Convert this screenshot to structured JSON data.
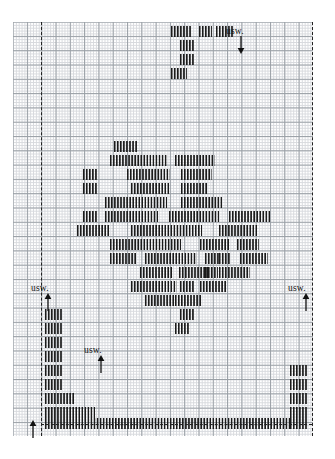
{
  "figure": {
    "type": "tally-mark-histogram-on-graph-paper",
    "width": 335,
    "height": 459,
    "background": "#ffffff",
    "grid": {
      "left": 13,
      "top": 22,
      "width": 300,
      "height": 414,
      "major_cell_px": 14.3,
      "minor_cell_px": 2.86,
      "major_color": "#9aa0a6",
      "minor_color": "#d8dade",
      "columns": 21,
      "rows": 29
    },
    "mark_color": "#1b1b1b",
    "dash_color": "#222222"
  },
  "labels": [
    {
      "id": "usw-top",
      "text": "usw.",
      "x": 226,
      "y": 26,
      "arrow": "down",
      "arrow_x": 236,
      "arrow_y": 36
    },
    {
      "id": "usw-left",
      "text": "usw.",
      "x": 31,
      "y": 283,
      "arrow": "up",
      "arrow_x": 43,
      "arrow_y": 293
    },
    {
      "id": "usw-right",
      "text": "usw.",
      "x": 288,
      "y": 283,
      "arrow": "up",
      "arrow_x": 301,
      "arrow_y": 293
    },
    {
      "id": "usw-middle",
      "text": "usw.",
      "x": 84,
      "y": 345,
      "arrow": "up",
      "arrow_x": 96,
      "arrow_y": 355
    }
  ],
  "arrows_standalone": [
    {
      "id": "axis-origin-arrow",
      "x": 28,
      "y": 420,
      "direction": "up"
    }
  ],
  "dashed_lines": {
    "vertical": [
      {
        "id": "left-boundary",
        "x": 41,
        "y": 22,
        "height": 414
      },
      {
        "id": "right-boundary",
        "x": 312,
        "y": 22,
        "height": 414
      }
    ],
    "horizontal": [
      {
        "id": "baseline",
        "x": 41,
        "y": 424,
        "width": 271
      }
    ]
  },
  "chart_data": {
    "type": "bar",
    "title": "",
    "xlabel": "",
    "ylabel": "",
    "note": "Tally-stroke rows. Each row is a horizontal run of short vertical strokes; x/width in px on the 335x459 canvas, stroke pitch ~3.05px.",
    "rows": [
      {
        "y": 26,
        "h": 11,
        "segments": [
          [
            171,
            21
          ],
          [
            199,
            13
          ],
          [
            216,
            17
          ]
        ]
      },
      {
        "y": 40,
        "h": 11,
        "segments": [
          [
            180,
            15
          ]
        ]
      },
      {
        "y": 54,
        "h": 11,
        "segments": [
          [
            180,
            15
          ]
        ]
      },
      {
        "y": 68,
        "h": 11,
        "segments": [
          [
            171,
            16
          ]
        ]
      },
      {
        "y": 141,
        "h": 11,
        "segments": [
          [
            114,
            24
          ]
        ]
      },
      {
        "y": 155,
        "h": 11,
        "segments": [
          [
            110,
            57
          ],
          [
            175,
            40
          ]
        ]
      },
      {
        "y": 169,
        "h": 11,
        "segments": [
          [
            83,
            14
          ],
          [
            127,
            43
          ],
          [
            181,
            31
          ]
        ]
      },
      {
        "y": 183,
        "h": 11,
        "segments": [
          [
            83,
            14
          ],
          [
            131,
            39
          ],
          [
            181,
            27
          ]
        ]
      },
      {
        "y": 197,
        "h": 11,
        "segments": [
          [
            105,
            62
          ],
          [
            181,
            41
          ]
        ]
      },
      {
        "y": 211,
        "h": 11,
        "segments": [
          [
            83,
            14
          ],
          [
            105,
            53
          ],
          [
            169,
            50
          ],
          [
            229,
            41
          ]
        ]
      },
      {
        "y": 225,
        "h": 11,
        "segments": [
          [
            77,
            32
          ],
          [
            131,
            71
          ],
          [
            219,
            38
          ]
        ]
      },
      {
        "y": 239,
        "h": 11,
        "segments": [
          [
            110,
            71
          ],
          [
            200,
            29
          ],
          [
            237,
            22
          ]
        ]
      },
      {
        "y": 253,
        "h": 11,
        "segments": [
          [
            110,
            27
          ],
          [
            145,
            52
          ],
          [
            205,
            14
          ],
          [
            219,
            12
          ],
          [
            240,
            28
          ]
        ]
      },
      {
        "y": 267,
        "h": 11,
        "segments": [
          [
            140,
            32
          ],
          [
            179,
            30
          ],
          [
            205,
            13
          ],
          [
            219,
            31
          ]
        ]
      },
      {
        "y": 281,
        "h": 11,
        "segments": [
          [
            131,
            46
          ],
          [
            180,
            14
          ],
          [
            200,
            27
          ]
        ]
      },
      {
        "y": 295,
        "h": 11,
        "segments": [
          [
            145,
            30
          ],
          [
            175,
            27
          ]
        ]
      },
      {
        "y": 309,
        "h": 11,
        "segments": [
          [
            45,
            17
          ],
          [
            180,
            14
          ]
        ]
      },
      {
        "y": 323,
        "h": 11,
        "segments": [
          [
            45,
            17
          ],
          [
            175,
            14
          ]
        ]
      },
      {
        "y": 337,
        "h": 11,
        "segments": [
          [
            45,
            17
          ]
        ]
      },
      {
        "y": 351,
        "h": 11,
        "segments": [
          [
            45,
            17
          ]
        ]
      },
      {
        "y": 365,
        "h": 11,
        "segments": [
          [
            45,
            17
          ],
          [
            290,
            17
          ]
        ]
      },
      {
        "y": 379,
        "h": 11,
        "segments": [
          [
            45,
            17
          ],
          [
            290,
            17
          ]
        ]
      },
      {
        "y": 393,
        "h": 11,
        "segments": [
          [
            45,
            30
          ],
          [
            290,
            17
          ]
        ]
      },
      {
        "y": 407,
        "h": 11,
        "segments": [
          [
            45,
            50
          ],
          [
            290,
            17
          ]
        ]
      },
      {
        "y": 418,
        "h": 11,
        "segments": [
          [
            45,
            245
          ],
          [
            290,
            17
          ]
        ]
      }
    ]
  }
}
